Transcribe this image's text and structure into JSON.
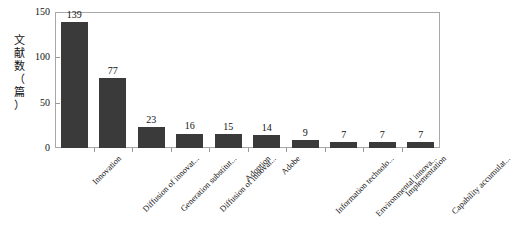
{
  "chart_data": {
    "type": "bar",
    "title": "",
    "xlabel": "",
    "ylabel": "文献数（篇）",
    "ylabel_stacked": "文\n献\n数\n（\n篇\n）",
    "ylim": [
      0,
      150
    ],
    "yticks": [
      0,
      50,
      100,
      150
    ],
    "ytick_labels": [
      "0",
      "50",
      "100",
      "150"
    ],
    "grid": false,
    "legend": "none",
    "bar_color": "#3a3a3a",
    "frame_color": "#a8a8a8",
    "categories": [
      "Innovation",
      "Diffusion of innovat...",
      "Generation substitut...",
      "Diffusion of innovat...",
      "Adoption",
      "Adobe",
      "Information technolo...",
      "Environmental innova...",
      "Implementation",
      "Capability accumulat..."
    ],
    "values": [
      139,
      77,
      23,
      16,
      15,
      14,
      9,
      7,
      7,
      7
    ],
    "value_labels": [
      "139",
      "77",
      "23",
      "16",
      "15",
      "14",
      "9",
      "7",
      "7",
      "7"
    ]
  }
}
